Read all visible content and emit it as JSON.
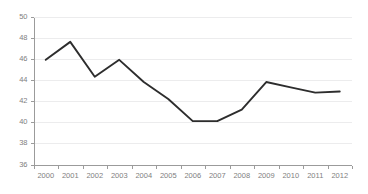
{
  "chart_data": {
    "type": "line",
    "title": "",
    "subtitle": "",
    "xlabel": "",
    "ylabel": "",
    "categories": [
      "2000",
      "2001",
      "2002",
      "2003",
      "2004",
      "2005",
      "2006",
      "2007",
      "2008",
      "2009",
      "2010",
      "2011",
      "2012"
    ],
    "series": [
      {
        "name": "",
        "values": [
          45.9,
          47.6,
          44.3,
          45.9,
          43.8,
          42.2,
          40.1,
          40.1,
          41.2,
          43.8,
          43.3,
          42.8,
          42.9
        ]
      }
    ],
    "x": [
      "2000",
      "2001",
      "2002",
      "2003",
      "2004",
      "2005",
      "2006",
      "2007",
      "2008",
      "2009",
      "2010",
      "2011",
      "2012"
    ],
    "ylim": [
      36,
      50
    ],
    "ytick_step": 2,
    "ytick_labels": [
      "36",
      "38",
      "40",
      "42",
      "44",
      "46",
      "48",
      "50"
    ],
    "xtick_labels": [
      "2000",
      "2001",
      "2002",
      "2003",
      "2004",
      "2005",
      "2006",
      "2007",
      "2008",
      "2009",
      "2010",
      "2011",
      "2012"
    ],
    "grid": true,
    "grid_axis": "y",
    "legend": false,
    "legend_position": "none",
    "colors": {
      "line": "#2d2d2d",
      "gridline": "#ececed",
      "axis": "#9b9b9b",
      "tick_label": "#808080",
      "background": "#ffffff"
    }
  }
}
